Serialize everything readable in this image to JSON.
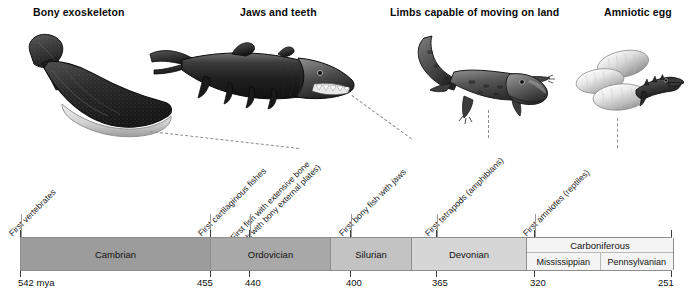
{
  "figure": {
    "title_row": [
      {
        "id": "bony-exoskeleton",
        "label": "Bony exoskeleton"
      },
      {
        "id": "jaws-and-teeth",
        "label": "Jaws and teeth"
      },
      {
        "id": "limbs-on-land",
        "label": "Limbs capable of moving on land"
      },
      {
        "id": "amniotic-egg",
        "label": "Amniotic egg"
      }
    ],
    "illustrations": [
      {
        "id": "ostracoderm-illustration",
        "caption": "Bony exoskeleton"
      },
      {
        "id": "placoderm-shark-illustration",
        "caption": "Jaws and teeth"
      },
      {
        "id": "tetrapod-salamander-illustration",
        "caption": "Limbs capable of moving on land"
      },
      {
        "id": "amniote-eggs-illustration",
        "caption": "Amniotic egg"
      }
    ],
    "events": [
      {
        "id": "first-vertebrates",
        "line1": "First vertebrates",
        "line2": ""
      },
      {
        "id": "first-cartilaginous-fishes",
        "line1": "First cartilaginous fishes",
        "line2": ""
      },
      {
        "id": "first-fish-extensive-bone",
        "line1": "First fish with extensive bone",
        "line2": "(fish with bony external plates)"
      },
      {
        "id": "first-bony-fish-with-jaws",
        "line1": "First bony fish with jaws",
        "line2": ""
      },
      {
        "id": "first-tetrapods",
        "line1": "First tetrapods (amphibians)",
        "line2": ""
      },
      {
        "id": "first-amniotes",
        "line1": "First amniotes (reptiles)",
        "line2": ""
      }
    ],
    "periods": [
      {
        "id": "cambrian",
        "name": "Cambrian",
        "fill": "#9c9c9c",
        "subperiods": []
      },
      {
        "id": "ordovician",
        "name": "Ordovician",
        "fill": "#a8a8a8",
        "subperiods": []
      },
      {
        "id": "silurian",
        "name": "Silurian",
        "fill": "#c3c3c3",
        "subperiods": []
      },
      {
        "id": "devonian",
        "name": "Devonian",
        "fill": "#d6d6d6",
        "subperiods": []
      },
      {
        "id": "carboniferous",
        "name": "Carboniferous",
        "fill": "#f4f4f4",
        "subperiods": [
          {
            "id": "mississippian",
            "name": "Mississippian"
          },
          {
            "id": "pennsylvanian",
            "name": "Pennsylvanian"
          }
        ]
      },
      {
        "id": "permian",
        "name": "Permian",
        "fill": "#fbfbfb",
        "subperiods": []
      }
    ],
    "axis": {
      "unit_label": "542 mya",
      "ticks": [
        {
          "value": "542 mya",
          "mya": 542
        },
        {
          "value": "455",
          "mya": 455
        },
        {
          "value": "440",
          "mya": 440
        },
        {
          "value": "400",
          "mya": 400
        },
        {
          "value": "365",
          "mya": 365
        },
        {
          "value": "320",
          "mya": 320
        },
        {
          "value": "251",
          "mya": 251
        }
      ]
    },
    "colors": {
      "bar_border": "#8d8d8d",
      "text": "#111111",
      "dashed_connector": "#8c8c8c",
      "leader_line": "#9a9a9a"
    }
  }
}
